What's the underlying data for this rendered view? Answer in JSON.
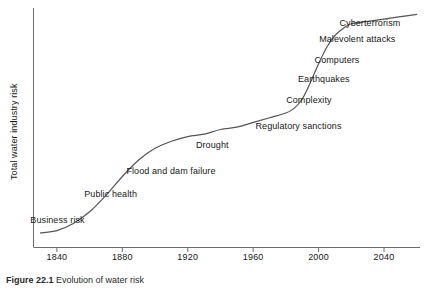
{
  "chart_data": {
    "type": "line",
    "title": "",
    "xlabel": "",
    "ylabel": "Total water industry risk",
    "xlim": [
      1826,
      2062
    ],
    "ylim": [
      0,
      100
    ],
    "grid": false,
    "legend": false,
    "xticks": [
      1840,
      1880,
      1920,
      1960,
      2000,
      2040
    ],
    "xtick_labels": [
      "1840",
      "1880",
      "1920",
      "1960",
      "2000",
      "2040"
    ],
    "yticks": [],
    "ytick_labels": [],
    "series": [
      {
        "name": "Total water industry risk",
        "x": [
          1830,
          1840,
          1850,
          1860,
          1870,
          1880,
          1890,
          1900,
          1910,
          1920,
          1930,
          1940,
          1950,
          1960,
          1970,
          1980,
          1985,
          1990,
          1995,
          2000,
          2005,
          2010,
          2015,
          2020,
          2030,
          2040,
          2050,
          2060
        ],
        "y": [
          6,
          7,
          10,
          15,
          22,
          30,
          37,
          42,
          45,
          47,
          48,
          50,
          51,
          53,
          55,
          57,
          59,
          63,
          70,
          78,
          85,
          90,
          93,
          95,
          96,
          97,
          98,
          99
        ]
      }
    ],
    "annotations": [
      {
        "label": "Business risk",
        "x": 1857,
        "y": 11
      },
      {
        "label": "Public health",
        "x": 1889,
        "y": 22
      },
      {
        "label": "Flood and dam failure",
        "x": 1937,
        "y": 32
      },
      {
        "label": "Drought",
        "x": 1945,
        "y": 43
      },
      {
        "label": "Regulatory sanctions",
        "x": 2014,
        "y": 51
      },
      {
        "label": "Complexity",
        "x": 2008,
        "y": 62
      },
      {
        "label": "Earthquakes",
        "x": 2019,
        "y": 71
      },
      {
        "label": "Computers",
        "x": 2025,
        "y": 79
      },
      {
        "label": "Malevolent attacks",
        "x": 2047,
        "y": 88
      },
      {
        "label": "Cyberterrorism",
        "x": 2050,
        "y": 95
      }
    ]
  },
  "axis": {
    "y_title": "Total water industry risk",
    "x_tick_labels": [
      "1840",
      "1880",
      "1920",
      "1960",
      "2000",
      "2040"
    ]
  },
  "annotations": [
    "Business risk",
    "Public health",
    "Flood and dam failure",
    "Drought",
    "Regulatory sanctions",
    "Complexity",
    "Earthquakes",
    "Computers",
    "Malevolent attacks",
    "Cyberterrorism"
  ],
  "caption": {
    "number": "Figure 22.1",
    "text": "Evolution of water risk"
  },
  "style": {
    "line_color": "#555555",
    "axis_color": "#6b6b6b",
    "text_color": "#171717",
    "background": "#ffffff"
  }
}
